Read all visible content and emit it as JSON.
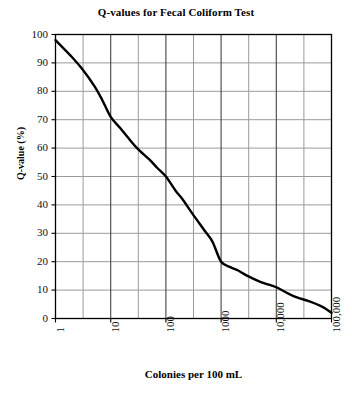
{
  "chart_data": {
    "type": "line",
    "title": "Q-values for Fecal Coliform Test",
    "xlabel": "Colonies per 100 mL",
    "ylabel": "Q-value (%)",
    "xscale": "log",
    "xlim": [
      1,
      100000
    ],
    "ylim": [
      0,
      100
    ],
    "grid": true,
    "legend": false,
    "x_tick_labels": [
      "1",
      "10",
      "100",
      "1000",
      "10,000",
      "100,000"
    ],
    "x_tick_values": [
      1,
      10,
      100,
      1000,
      10000,
      100000
    ],
    "y_tick_labels": [
      "0",
      "10",
      "20",
      "30",
      "40",
      "50",
      "60",
      "70",
      "80",
      "90",
      "100"
    ],
    "y_tick_values": [
      0,
      10,
      20,
      30,
      40,
      50,
      60,
      70,
      80,
      90,
      100
    ],
    "series": [
      {
        "name": "Q-value",
        "color": "#000000",
        "x": [
          1,
          2,
          3,
          5,
          7,
          10,
          15,
          20,
          30,
          50,
          70,
          100,
          150,
          200,
          300,
          500,
          700,
          1000,
          1500,
          2000,
          3000,
          5000,
          7000,
          10000,
          20000,
          40000,
          70000,
          100000
        ],
        "values": [
          98,
          92,
          88,
          82,
          77,
          71,
          67,
          64,
          60,
          56,
          53,
          50,
          45,
          42,
          37,
          31,
          27,
          20,
          18,
          17,
          15,
          13,
          12,
          11,
          8,
          6,
          4,
          2
        ]
      }
    ],
    "annotations": []
  },
  "axes": {
    "y_title": "Q-value (%)",
    "x_title": "Colonies per 100 mL"
  },
  "colors": {
    "curve": "#000000",
    "major_grid": "#444444",
    "minor_grid": "#9a9a9a",
    "axis": "#000000",
    "background": "#ffffff"
  }
}
